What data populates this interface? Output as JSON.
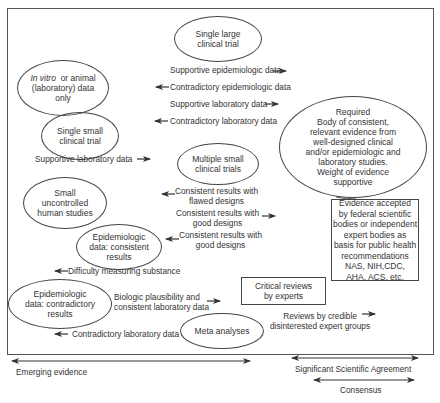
{
  "nodes": {
    "in_vitro": {
      "lines": [
        "In vitro  or animal",
        "(laboratory) data",
        "only"
      ],
      "italic_prefix": "In vitro"
    },
    "single_large": {
      "lines": [
        "Single large",
        "clinical trial"
      ]
    },
    "single_small": {
      "lines": [
        "Single small",
        "clinical trial"
      ]
    },
    "multiple_small": {
      "lines": [
        "Multiple small",
        "clinical trials"
      ]
    },
    "small_uncontrolled": {
      "lines": [
        "Small",
        "uncontrolled",
        "human studies"
      ]
    },
    "epi_consistent": {
      "lines": [
        "Epidemiologic",
        "data: consistent",
        "results"
      ]
    },
    "epi_contradictory": {
      "lines": [
        "Epidemiologic",
        "data: contradictory",
        "results"
      ]
    },
    "meta": {
      "lines": [
        "Meta analyses"
      ]
    },
    "required": {
      "lines": [
        "Required",
        "Body of consistent,",
        "relevant evidence from",
        "well-designed clinical",
        "and/or epidemiologic and",
        "laboratory studies.",
        "Weight of evidence",
        "supportive"
      ]
    },
    "accepted": {
      "lines": [
        "Evidence accepted",
        "by federal scientific",
        "bodies or independent",
        "expert bodies as",
        "basis for public health",
        "recommendations",
        "NAS, NIH,CDC,",
        "AHA, ACS, etc."
      ]
    },
    "critical": {
      "lines": [
        "Critical reviews",
        "by experts"
      ]
    }
  },
  "labels": {
    "supp_epi": "Supportive epidemiologic data",
    "contra_epi": "Contradictory epidemiologic data",
    "supp_lab": "Supportive laboratory data",
    "contra_lab": "Contradictory laboratory data",
    "supp_lab_small": "Supportive laboratory data",
    "flawed": [
      "Consistent results with",
      "flawed designs"
    ],
    "good1": [
      "Consistent results with",
      "good designs"
    ],
    "good2": [
      "Consistent results with",
      "good designs"
    ],
    "difficulty": "Difficulty measuring substance",
    "biologic": [
      "Biologic plausibility and",
      "consistent laboratory data"
    ],
    "contra_lab2": "Contradictory laboratory data",
    "reviews": [
      "Reviews by credible",
      "disinterested expert groups"
    ]
  },
  "scale": {
    "emerging": "Emerging evidence",
    "significant": "Significant Scientific Agreement",
    "consensus": "Consensus"
  },
  "colors": {
    "line": "#444444",
    "text": "#333333",
    "background": "#ffffff"
  }
}
